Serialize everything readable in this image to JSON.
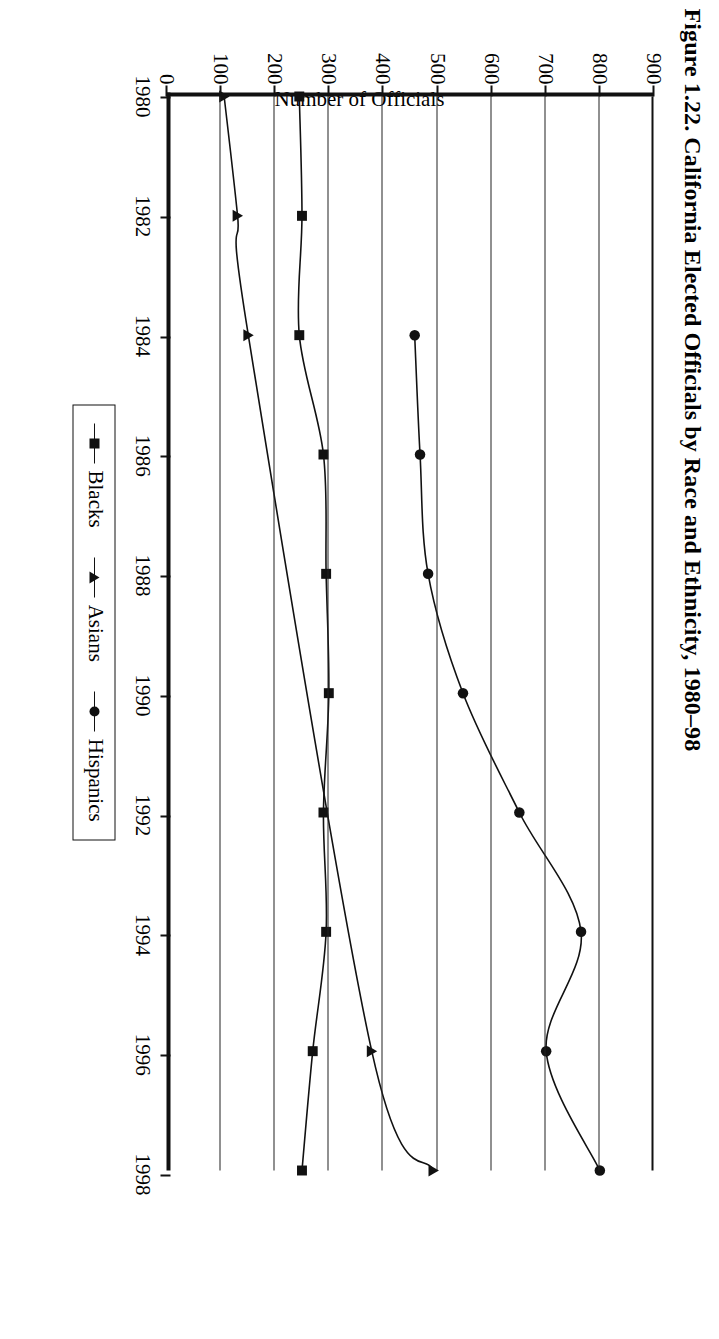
{
  "figure": {
    "title": "Figure 1.22. California Elected Officials by Race and Ethnicity, 1980–98"
  },
  "axes": {
    "y_title": "Number of Officials",
    "y_ticks": [
      "900",
      "800",
      "700",
      "600",
      "500",
      "400",
      "300",
      "200",
      "100",
      "0"
    ],
    "x_ticks": [
      "1980",
      "1982",
      "1984",
      "1986",
      "1988",
      "1990",
      "1992",
      "1994",
      "1996",
      "1998"
    ]
  },
  "legend": {
    "items": [
      {
        "label": "Blacks",
        "marker": "square-marker"
      },
      {
        "label": "Asians",
        "marker": "triangle-marker"
      },
      {
        "label": "Hispanics",
        "marker": "circle-marker"
      }
    ]
  },
  "chart_data": {
    "type": "line",
    "title": "Figure 1.22. California Elected Officials by Race and Ethnicity, 1980–98",
    "xlabel": "",
    "ylabel": "Number of Officials",
    "ylim": [
      0,
      900
    ],
    "xlim": [
      1980,
      1998
    ],
    "grid": true,
    "legend_position": "bottom-center",
    "x": [
      1980,
      1982,
      1984,
      1986,
      1988,
      1990,
      1992,
      1994,
      1996,
      1998
    ],
    "series": [
      {
        "name": "Blacks",
        "marker": "square",
        "x": [
          1980,
          1982,
          1984,
          1986,
          1988,
          1990,
          1992,
          1994,
          1996,
          1998
        ],
        "values": [
          240,
          245,
          240,
          285,
          290,
          295,
          285,
          290,
          265,
          245
        ]
      },
      {
        "name": "Asians",
        "marker": "triangle",
        "x": [
          1980,
          1982,
          1984,
          1996,
          1998
        ],
        "values": [
          100,
          125,
          145,
          375,
          490
        ]
      },
      {
        "name": "Hispanics",
        "marker": "circle",
        "x": [
          1984,
          1986,
          1988,
          1990,
          1992,
          1994,
          1996,
          1998
        ],
        "values": [
          455,
          465,
          480,
          545,
          650,
          765,
          700,
          800
        ]
      }
    ]
  }
}
